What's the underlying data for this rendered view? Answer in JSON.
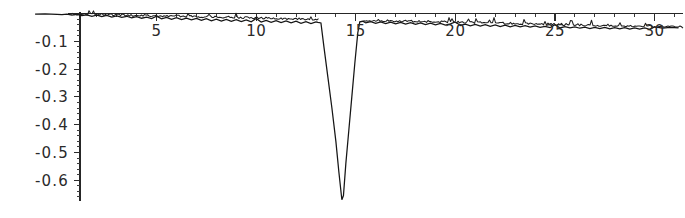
{
  "chart_data": {
    "type": "line",
    "title": "",
    "subtitle": "",
    "xlabel": "",
    "ylabel": "",
    "xlim": [
      -1.2,
      31.5
    ],
    "ylim": [
      -0.68,
      0.02
    ],
    "grid": false,
    "legend_position": "none",
    "x_ticks_major": [
      5,
      10,
      15,
      20,
      25,
      30
    ],
    "x_tick_labels": [
      "5",
      "10",
      "15",
      "20",
      "25",
      "30"
    ],
    "y_ticks_major": [
      -0.1,
      -0.2,
      -0.3,
      -0.4,
      -0.5,
      -0.6
    ],
    "y_tick_labels": [
      "-0.1",
      "-0.2",
      "-0.3",
      "-0.4",
      "-0.5",
      "-0.6"
    ],
    "x_tick_minor_step": 1,
    "y_tick_minor_step": 0.02,
    "series": [
      {
        "name": "signal",
        "color": "#151515",
        "description": "Noisy near-zero baseline with slight downward drift and one sharp negative V-shaped spike near x = 14.3",
        "points": [
          [
            -1.1,
            -0.002
          ],
          [
            -0.6,
            -0.001
          ],
          [
            0.0,
            -0.003
          ],
          [
            0.25,
            -0.004
          ],
          [
            0.5,
            -0.002
          ],
          [
            0.75,
            -0.006
          ],
          [
            1.0,
            -0.003
          ],
          [
            1.25,
            -0.008
          ],
          [
            1.5,
            -0.005
          ],
          [
            1.75,
            -0.01
          ],
          [
            2.0,
            -0.006
          ],
          [
            2.25,
            -0.011
          ],
          [
            2.5,
            -0.007
          ],
          [
            2.75,
            -0.013
          ],
          [
            3.0,
            -0.009
          ],
          [
            3.25,
            -0.014
          ],
          [
            3.5,
            -0.01
          ],
          [
            3.75,
            -0.016
          ],
          [
            4.0,
            -0.011
          ],
          [
            4.25,
            -0.017
          ],
          [
            4.5,
            -0.013
          ],
          [
            4.75,
            -0.018
          ],
          [
            5.0,
            -0.01
          ],
          [
            5.25,
            -0.019
          ],
          [
            5.5,
            -0.014
          ],
          [
            5.75,
            -0.021
          ],
          [
            6.0,
            -0.015
          ],
          [
            6.25,
            -0.022
          ],
          [
            6.5,
            -0.017
          ],
          [
            6.75,
            -0.023
          ],
          [
            7.0,
            -0.018
          ],
          [
            7.25,
            -0.025
          ],
          [
            7.5,
            -0.019
          ],
          [
            7.75,
            -0.026
          ],
          [
            8.0,
            -0.02
          ],
          [
            8.25,
            -0.027
          ],
          [
            8.5,
            -0.021
          ],
          [
            8.75,
            -0.028
          ],
          [
            9.0,
            -0.022
          ],
          [
            9.25,
            -0.029
          ],
          [
            9.5,
            -0.023
          ],
          [
            9.75,
            -0.03
          ],
          [
            10.0,
            -0.018
          ],
          [
            10.25,
            -0.031
          ],
          [
            10.5,
            -0.025
          ],
          [
            10.75,
            -0.032
          ],
          [
            11.0,
            -0.026
          ],
          [
            11.25,
            -0.033
          ],
          [
            11.5,
            -0.027
          ],
          [
            11.75,
            -0.034
          ],
          [
            12.0,
            -0.028
          ],
          [
            12.25,
            -0.035
          ],
          [
            12.5,
            -0.029
          ],
          [
            12.75,
            -0.036
          ],
          [
            13.0,
            -0.03
          ],
          [
            13.1,
            -0.032
          ],
          [
            13.25,
            -0.034
          ],
          [
            13.4,
            -0.12
          ],
          [
            13.6,
            -0.23
          ],
          [
            13.8,
            -0.34
          ],
          [
            14.0,
            -0.46
          ],
          [
            14.15,
            -0.57
          ],
          [
            14.3,
            -0.67
          ],
          [
            14.38,
            -0.655
          ],
          [
            14.5,
            -0.54
          ],
          [
            14.65,
            -0.42
          ],
          [
            14.8,
            -0.3
          ],
          [
            14.95,
            -0.18
          ],
          [
            15.1,
            -0.07
          ],
          [
            15.2,
            -0.03
          ],
          [
            15.35,
            -0.028
          ],
          [
            15.5,
            -0.034
          ],
          [
            15.75,
            -0.029
          ],
          [
            16.0,
            -0.035
          ],
          [
            16.25,
            -0.03
          ],
          [
            16.5,
            -0.036
          ],
          [
            16.75,
            -0.031
          ],
          [
            17.0,
            -0.037
          ],
          [
            17.25,
            -0.032
          ],
          [
            17.5,
            -0.038
          ],
          [
            17.75,
            -0.033
          ],
          [
            18.0,
            -0.039
          ],
          [
            18.25,
            -0.034
          ],
          [
            18.5,
            -0.04
          ],
          [
            18.75,
            -0.035
          ],
          [
            19.0,
            -0.041
          ],
          [
            19.25,
            -0.036
          ],
          [
            19.5,
            -0.042
          ],
          [
            19.75,
            -0.037
          ],
          [
            20.0,
            -0.03
          ],
          [
            20.25,
            -0.043
          ],
          [
            20.5,
            -0.038
          ],
          [
            20.75,
            -0.044
          ],
          [
            21.0,
            -0.039
          ],
          [
            21.25,
            -0.045
          ],
          [
            21.5,
            -0.04
          ],
          [
            21.75,
            -0.046
          ],
          [
            22.0,
            -0.041
          ],
          [
            22.25,
            -0.047
          ],
          [
            22.5,
            -0.042
          ],
          [
            22.75,
            -0.048
          ],
          [
            23.0,
            -0.043
          ],
          [
            23.25,
            -0.048
          ],
          [
            23.5,
            -0.044
          ],
          [
            23.75,
            -0.049
          ],
          [
            24.0,
            -0.045
          ],
          [
            24.25,
            -0.05
          ],
          [
            24.5,
            -0.046
          ],
          [
            24.75,
            -0.051
          ],
          [
            25.0,
            -0.04
          ],
          [
            25.25,
            -0.052
          ],
          [
            25.5,
            -0.047
          ],
          [
            25.75,
            -0.052
          ],
          [
            26.0,
            -0.048
          ],
          [
            26.25,
            -0.053
          ],
          [
            26.5,
            -0.049
          ],
          [
            26.75,
            -0.054
          ],
          [
            27.0,
            -0.05
          ],
          [
            27.25,
            -0.054
          ],
          [
            27.5,
            -0.05
          ],
          [
            27.75,
            -0.055
          ],
          [
            28.0,
            -0.051
          ],
          [
            28.25,
            -0.055
          ],
          [
            28.5,
            -0.051
          ],
          [
            28.75,
            -0.056
          ],
          [
            29.0,
            -0.052
          ],
          [
            29.25,
            -0.056
          ],
          [
            29.5,
            -0.052
          ],
          [
            29.75,
            -0.057
          ],
          [
            30.0,
            -0.048
          ],
          [
            30.4,
            -0.053
          ],
          [
            30.8,
            -0.05
          ],
          [
            31.2,
            -0.052
          ]
        ],
        "spike": {
          "x_start": 13.3,
          "x_min": 14.3,
          "y_min": -0.67,
          "x_end": 15.2
        },
        "baseline_start_y": -0.002,
        "baseline_end_y": -0.052
      }
    ]
  },
  "axes": {
    "x_axis_name": "horizontal-axis",
    "y_axis_name": "vertical-axis"
  }
}
